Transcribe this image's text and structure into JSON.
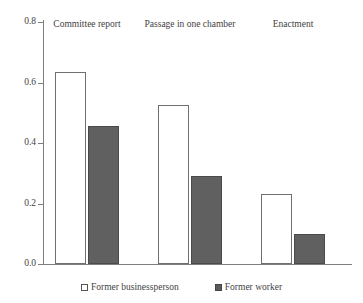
{
  "chart_data": {
    "type": "bar",
    "title": "",
    "xlabel": "",
    "ylabel": "",
    "ylim": [
      0,
      0.8
    ],
    "grid": false,
    "legend_position": "bottom",
    "categories": [
      "Committee report",
      "Passage in one chamber",
      "Enactment"
    ],
    "y_ticks": [
      "0.0",
      "0.2",
      "0.4",
      "0.6",
      "0.8"
    ],
    "y_tick_values": [
      0.0,
      0.2,
      0.4,
      0.6,
      0.8
    ],
    "series": [
      {
        "name": "Former businessperson",
        "style": "open",
        "color": "#ffffff",
        "border_color": "#6f6f6f",
        "values": [
          0.635,
          0.525,
          0.23
        ]
      },
      {
        "name": "Former worker",
        "style": "filled",
        "color": "#606060",
        "border_color": "#4a4a4a",
        "values": [
          0.455,
          0.29,
          0.1
        ]
      }
    ]
  },
  "legend": {
    "items": [
      {
        "label": "Former businessperson",
        "swatch": "open-square-icon"
      },
      {
        "label": "Former worker",
        "swatch": "filled-square-icon"
      }
    ]
  }
}
